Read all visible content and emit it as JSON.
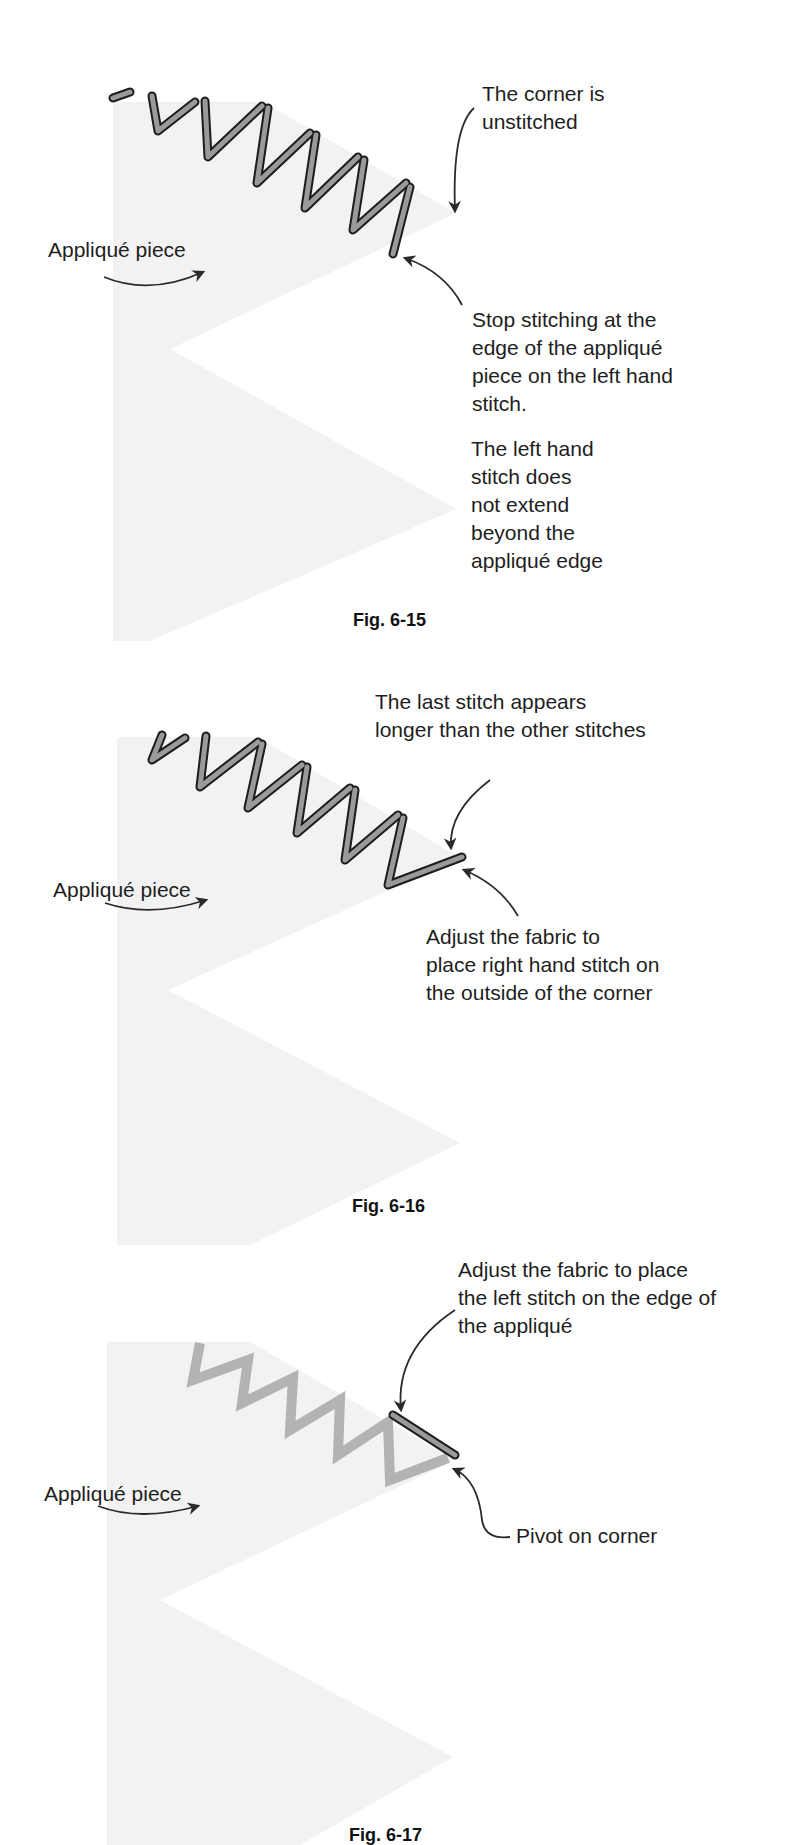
{
  "figures": [
    {
      "id": "fig-6-15",
      "caption": "Fig. 6-15",
      "applique_label": "Appliqué piece",
      "callouts": [
        {
          "name": "corner-unstitched",
          "text": "The corner is\nunstitched"
        },
        {
          "name": "stop-stitching",
          "text": "Stop stitching at the\nedge of the appliqué\npiece on the left hand\nstitch."
        },
        {
          "name": "left-stitch-no-extend",
          "text": "The left hand\nstitch does\nnot extend\nbeyond the\nappliqué edge"
        }
      ]
    },
    {
      "id": "fig-6-16",
      "caption": "Fig. 6-16",
      "applique_label": "Appliqué piece",
      "callouts": [
        {
          "name": "last-stitch-longer",
          "text": "The last stitch appears\nlonger than the other stitches"
        },
        {
          "name": "adjust-right-stitch",
          "text": "Adjust the fabric to\nplace right hand stitch on\nthe outside of the corner"
        }
      ]
    },
    {
      "id": "fig-6-17",
      "caption": "Fig. 6-17",
      "applique_label": "Appliqué piece",
      "callouts": [
        {
          "name": "adjust-left-stitch",
          "text": "Adjust the fabric to place\nthe left stitch on the edge of\nthe appliqué"
        },
        {
          "name": "pivot-on-corner",
          "text": "Pivot on corner"
        }
      ]
    }
  ],
  "colors": {
    "applique_fill": "#f2f2f2",
    "stitch_fill": "#9a9a9a",
    "stitch_outline": "#1c1c1c",
    "previous_stitch": "#b3b3b3",
    "text": "#1e1e1e"
  }
}
